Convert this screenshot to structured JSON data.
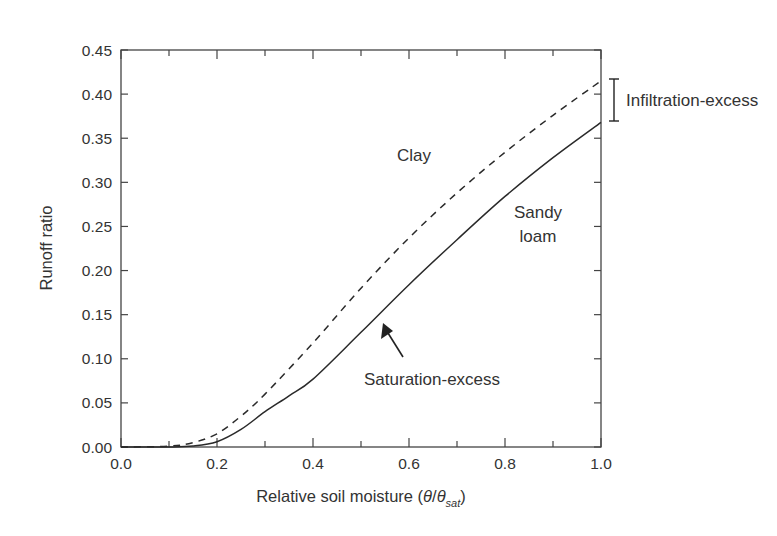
{
  "chart_data": {
    "type": "line",
    "title": "",
    "xlabel": "Relative soil moisture (θ/θ_sat)",
    "xlabel_parts": {
      "main": "Relative soil moisture (",
      "theta": "θ",
      "slash": "/",
      "theta2": "θ",
      "sub": "sat",
      "close": ")"
    },
    "ylabel": "Runoff ratio",
    "xlim": [
      0.0,
      1.0
    ],
    "ylim": [
      0.0,
      0.45
    ],
    "x_ticks": [
      "0.0",
      "0.2",
      "0.4",
      "0.6",
      "0.8",
      "1.0"
    ],
    "y_ticks": [
      "0.00",
      "0.05",
      "0.10",
      "0.15",
      "0.20",
      "0.25",
      "0.30",
      "0.35",
      "0.40",
      "0.45"
    ],
    "grid": false,
    "legend": "none (inline labels)",
    "series": [
      {
        "name": "Clay",
        "style": "dashed",
        "x": [
          0.0,
          0.1,
          0.15,
          0.2,
          0.25,
          0.3,
          0.4,
          0.5,
          0.6,
          0.7,
          0.8,
          0.9,
          1.0
        ],
        "values": [
          0.0,
          0.001,
          0.005,
          0.015,
          0.035,
          0.06,
          0.118,
          0.18,
          0.237,
          0.288,
          0.334,
          0.376,
          0.415
        ]
      },
      {
        "name": "Sandy loam",
        "style": "solid",
        "x": [
          0.0,
          0.1,
          0.15,
          0.2,
          0.25,
          0.3,
          0.35,
          0.4,
          0.5,
          0.6,
          0.7,
          0.8,
          0.9,
          1.0
        ],
        "values": [
          0.0,
          0.0,
          0.001,
          0.006,
          0.02,
          0.04,
          0.058,
          0.077,
          0.13,
          0.184,
          0.235,
          0.284,
          0.328,
          0.368
        ]
      }
    ],
    "annotations": [
      {
        "text": "Clay",
        "x": 0.5,
        "y": 0.33
      },
      {
        "text": "Sandy",
        "x": 0.86,
        "y": 0.265
      },
      {
        "text": "loam",
        "x": 0.86,
        "y": 0.24
      },
      {
        "text": "Saturation-excess",
        "x": 0.68,
        "y": 0.075,
        "arrow_to": [
          0.54,
          0.155
        ]
      },
      {
        "text": "Infiltration-excess",
        "bracket_range": [
          0.368,
          0.415
        ]
      }
    ]
  }
}
